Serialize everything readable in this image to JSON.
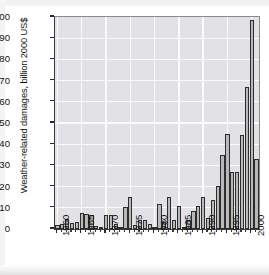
{
  "chart": {
    "type": "bar",
    "ylabel": "Weather-related damages, billion 2000 US$",
    "xlabel": ""
  },
  "chart_data": {
    "type": "bar",
    "title": "",
    "xlabel": "",
    "ylabel": "Weather-related damages, billion 2000 US$",
    "ylim": [
      0,
      100
    ],
    "ytick_labels": [
      "0",
      "10",
      "20",
      "30",
      "40",
      "50",
      "60",
      "70",
      "80",
      "90",
      "100"
    ],
    "ytick_values": [
      0,
      10,
      20,
      30,
      40,
      50,
      60,
      70,
      80,
      90,
      100
    ],
    "xtick_labels": [
      "1960",
      "1965",
      "1970",
      "1975",
      "1980",
      "1985",
      "1990",
      "1995",
      "2000"
    ],
    "xtick_values": [
      1960,
      1965,
      1970,
      1975,
      1980,
      1985,
      1990,
      1995,
      2000
    ],
    "xlim": [
      1959.5,
      2001.5
    ],
    "grid": "horizontal-and-vertical-white",
    "legend": "none",
    "bar_fill_color": "#b9b9b9",
    "bar_edge_color": "#2e2e2e",
    "plot_background_color": "#e2e2e6",
    "gridline_color": "#fbfbfb",
    "categories": [
      "1960",
      "1961",
      "1962",
      "1963",
      "1964",
      "1965",
      "1966",
      "1967",
      "1968",
      "1969",
      "1970",
      "1971",
      "1972",
      "1973",
      "1974",
      "1975",
      "1976",
      "1977",
      "1978",
      "1979",
      "1980",
      "1981",
      "1982",
      "1983",
      "1984",
      "1985",
      "1986",
      "1987",
      "1988",
      "1989",
      "1990",
      "1991",
      "1992",
      "1993",
      "1994",
      "1995",
      "1996",
      "1997",
      "1998",
      "1999",
      "2000",
      "2001"
    ],
    "values": [
      2.0,
      2.2,
      4.6,
      3.0,
      3.2,
      7.7,
      7.0,
      6.6,
      1.4,
      0.2,
      6.6,
      6.7,
      2.5,
      0.2,
      10.4,
      15.1,
      1.8,
      4.4,
      4.2,
      2.6,
      0.3,
      11.6,
      3.2,
      15.0,
      4.1,
      11.0,
      0.3,
      4.4,
      8.5,
      10.9,
      14.9,
      5.3,
      13.8,
      20.2,
      34.7,
      44.8,
      27.1,
      26.7,
      44.2,
      66.8,
      98.8,
      33.0
    ],
    "series_name": "Weather-related damages"
  }
}
